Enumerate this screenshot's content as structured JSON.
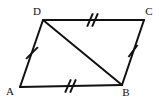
{
  "figure": {
    "type": "geometry-diagram",
    "shape_name": "parallelogram-with-diagonal",
    "background_color": "#ffffff",
    "stroke_color": "#111111",
    "stroke_width": 2,
    "canvas": {
      "width": 159,
      "height": 105
    },
    "vertices": [
      {
        "id": "A",
        "label": "A",
        "x": 20,
        "y": 87,
        "label_x": 10,
        "label_y": 92
      },
      {
        "id": "B",
        "label": "B",
        "x": 122,
        "y": 85,
        "label_x": 126,
        "label_y": 93
      },
      {
        "id": "C",
        "label": "C",
        "x": 144,
        "y": 20,
        "label_x": 149,
        "label_y": 12
      },
      {
        "id": "D",
        "label": "D",
        "x": 43,
        "y": 20,
        "label_x": 37,
        "label_y": 12
      }
    ],
    "edges": [
      {
        "id": "AD",
        "from": "A",
        "to": "D",
        "x1": 20,
        "y1": 87,
        "x2": 43,
        "y2": 20,
        "tick_count": 1
      },
      {
        "id": "DC",
        "from": "D",
        "to": "C",
        "x1": 43,
        "y1": 20,
        "x2": 144,
        "y2": 20,
        "tick_count": 2
      },
      {
        "id": "CB",
        "from": "C",
        "to": "B",
        "x1": 144,
        "y1": 20,
        "x2": 122,
        "y2": 85,
        "tick_count": 1
      },
      {
        "id": "BA",
        "from": "B",
        "to": "A",
        "x1": 122,
        "y1": 85,
        "x2": 20,
        "y2": 87,
        "tick_count": 2
      },
      {
        "id": "DB",
        "from": "D",
        "to": "B",
        "x1": 43,
        "y1": 20,
        "x2": 122,
        "y2": 85,
        "tick_count": 0
      }
    ],
    "tick_marks": [
      {
        "id": "tick-AD",
        "edge": "AD",
        "count": 1,
        "cx": 32,
        "cy": 53,
        "angle_deg": 25,
        "length": 13
      },
      {
        "id": "tick-DC",
        "edge": "DC",
        "count": 2,
        "cx": 92,
        "cy": 20,
        "angle_deg": 20,
        "length": 14,
        "spacing": 5
      },
      {
        "id": "tick-CB",
        "edge": "CB",
        "count": 1,
        "cx": 133,
        "cy": 51,
        "angle_deg": -20,
        "length": 13
      },
      {
        "id": "tick-BA",
        "edge": "BA",
        "count": 2,
        "cx": 70,
        "cy": 86,
        "angle_deg": 20,
        "length": 14,
        "spacing": 5
      }
    ]
  }
}
